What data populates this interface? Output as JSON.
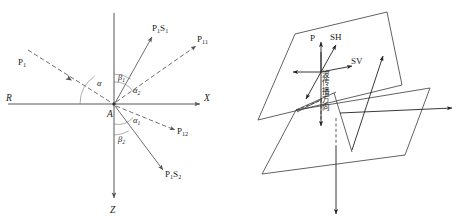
{
  "figure": {
    "panels": [
      {
        "id": "left",
        "name": "ray-geometry-panel",
        "description": "Incident P wave at interface point A with reflected and transmitted P and S rays in X-Z plane",
        "origin_label": "A",
        "axes": [
          {
            "name": "x-axis",
            "label": "X",
            "direction": "right"
          },
          {
            "name": "z-axis",
            "label": "Z",
            "direction": "down"
          },
          {
            "name": "r-axis",
            "label": "R",
            "direction": "left"
          }
        ],
        "rays": [
          {
            "name": "incident-p1",
            "label_main": "P",
            "label_sub": "1",
            "style": "dashed"
          },
          {
            "name": "reflected-ps1",
            "label_main": "P",
            "label_sub1": "1",
            "label_s": "S",
            "label_sub2": "1",
            "style": "solid"
          },
          {
            "name": "reflected-p11",
            "label_main": "P",
            "label_sub": "11",
            "style": "dashed"
          },
          {
            "name": "transmitted-p12",
            "label_main": "P",
            "label_sub": "12",
            "style": "dashed"
          },
          {
            "name": "transmitted-ps2",
            "label_main": "P",
            "label_sub1": "1",
            "label_s": "S",
            "label_sub2": "2",
            "style": "solid"
          }
        ],
        "angles": [
          {
            "name": "angle-alpha",
            "symbol": "α",
            "sub": ""
          },
          {
            "name": "angle-beta1",
            "symbol": "β",
            "sub": "1"
          },
          {
            "name": "angle-alpha2",
            "symbol": "α",
            "sub": "2"
          },
          {
            "name": "angle-alpha1",
            "symbol": "α",
            "sub": "1"
          },
          {
            "name": "angle-beta2",
            "symbol": "β",
            "sub": "2"
          }
        ]
      },
      {
        "id": "right",
        "name": "polarization-panel",
        "description": "Two parallel wavefront planes with P, SH and SV particle motion vectors and propagation direction",
        "vectors": [
          {
            "name": "p-vector",
            "label": "P"
          },
          {
            "name": "sh-vector",
            "label": "SH"
          },
          {
            "name": "sv-vector",
            "label": "SV"
          }
        ],
        "propagation_label": "波传播方向"
      }
    ]
  },
  "colors": {
    "line": "#555555",
    "axis": "#444444",
    "plane": "#3a3a3a",
    "text": "#1a1a1a",
    "background": "#ffffff"
  }
}
